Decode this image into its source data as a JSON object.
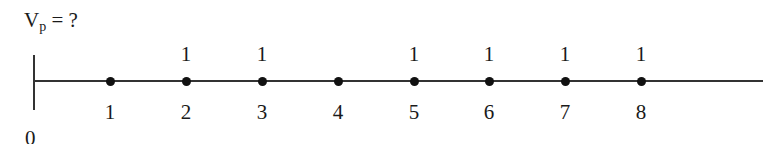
{
  "title": {
    "main": "V",
    "sub": "p",
    "rest": " = ?"
  },
  "origin_label": "0",
  "points": [
    {
      "index": "1",
      "value": "",
      "x": 110
    },
    {
      "index": "2",
      "value": "1",
      "x": 186
    },
    {
      "index": "3",
      "value": "1",
      "x": 262
    },
    {
      "index": "4",
      "value": "",
      "x": 338
    },
    {
      "index": "5",
      "value": "1",
      "x": 414
    },
    {
      "index": "6",
      "value": "1",
      "x": 489
    },
    {
      "index": "7",
      "value": "1",
      "x": 565
    },
    {
      "index": "8",
      "value": "1",
      "x": 641
    }
  ]
}
